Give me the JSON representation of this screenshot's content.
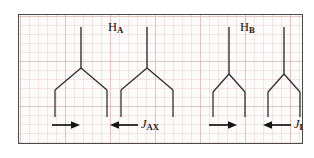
{
  "diagram": {
    "title_hidden": "NMR first-order splitting tree diagram",
    "frame": {
      "border_color": "#4a4a4a",
      "paper_color": "#fdfcfb",
      "grid_color": "#d6aaaa"
    },
    "line_color": "#2a2a2a",
    "labels": {
      "h_a": "H",
      "h_a_sub": "A",
      "h_b": "H",
      "h_b_sub": "B",
      "j_ax": "J",
      "j_ax_sub": "AX",
      "j_bx": "J",
      "j_bx_sub": "BX"
    },
    "multiplets": [
      {
        "name": "H_A",
        "label": "HA",
        "description": "doublet of doublets, two sub-trees each splitting into two lines",
        "sub_trees": [
          {
            "stem_x": 62,
            "split_half_width": 26,
            "leaf_count": 2
          },
          {
            "stem_x": 128,
            "split_half_width": 26,
            "leaf_count": 2
          }
        ],
        "leaf_positions": [
          36,
          88,
          102,
          154
        ],
        "coupling": "J_AX"
      },
      {
        "name": "H_B",
        "label": "HB",
        "description": "doublet of doublets, two sub-trees each splitting into two lines, smaller splitting",
        "sub_trees": [
          {
            "stem_x": 210,
            "split_half_width": 16,
            "leaf_count": 2
          },
          {
            "stem_x": 265,
            "split_half_width": 16,
            "leaf_count": 2
          }
        ],
        "leaf_positions": [
          194,
          226,
          249,
          281
        ],
        "coupling": "J_BX"
      }
    ],
    "coupling_markers": [
      {
        "id": "arrow-right-a",
        "direction": "right",
        "x_from": 33,
        "x_to": 60,
        "y": 124
      },
      {
        "id": "arrow-left-a",
        "direction": "left",
        "x_from": 119,
        "x_to": 92,
        "y": 124,
        "label": "J_AX"
      },
      {
        "id": "arrow-right-b",
        "direction": "right",
        "x_from": 190,
        "x_to": 217,
        "y": 124
      },
      {
        "id": "arrow-left-b",
        "direction": "left",
        "x_from": 272,
        "x_to": 245,
        "y": 124,
        "label": "J_BX"
      }
    ]
  }
}
